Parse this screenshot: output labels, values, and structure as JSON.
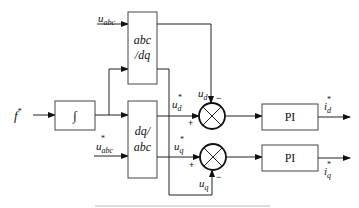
{
  "diagram": {
    "type": "block-diagram",
    "inputs": {
      "f_star": "f",
      "f_star_sup": "*",
      "u_abc": "u",
      "u_abc_sub": "abc",
      "u_abc_star": "u",
      "u_abc_star_sub": "abc",
      "u_abc_star_sup": "*"
    },
    "blocks": {
      "integrator": "∫",
      "abc_dq_line1": "abc",
      "abc_dq_line2": "/dq",
      "dq_abc_line1": "dq/",
      "dq_abc_line2": "abc",
      "pi_d": "PI",
      "pi_q": "PI"
    },
    "signals": {
      "u_d": "u",
      "u_d_sub": "d",
      "u_q": "u",
      "u_q_sub": "q",
      "u_d_star": "u",
      "u_d_star_sub": "d",
      "u_d_star_sup": "*",
      "u_q_star": "u",
      "u_q_star_sub": "q",
      "u_q_star_sup": "*",
      "i_d_star": "i",
      "i_d_star_sub": "d",
      "i_d_star_sup": "*",
      "i_q_star": "i",
      "i_q_star_sub": "q",
      "i_q_star_sup": "*"
    },
    "signs": {
      "sum_d_top": "−",
      "sum_d_left": "+",
      "sum_q_left": "+",
      "sum_q_bottom": "−"
    }
  }
}
